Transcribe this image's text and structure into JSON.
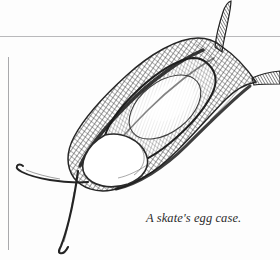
{
  "plate": {
    "title": "A skate's egg case.",
    "caption": "A skate's egg case.",
    "background_color": "#fdfdfd",
    "ink_color": "#2b2b2b",
    "rule_color": "#b9b9bb",
    "subject": "skate egg case",
    "medium": "engraving",
    "rules": {
      "horizontal_label": "horizontal-rule",
      "vertical_label": "vertical-rule"
    },
    "parts": {
      "body_label": "egg-case-body",
      "inner_mass_label": "inner-egg-mass",
      "aperture_label": "aperture-opening",
      "horn_upper_right_label": "horn-upper-right",
      "horn_right_label": "horn-right",
      "tendril_left_label": "tendril-left",
      "tendril_lower_label": "tendril-lower"
    }
  }
}
